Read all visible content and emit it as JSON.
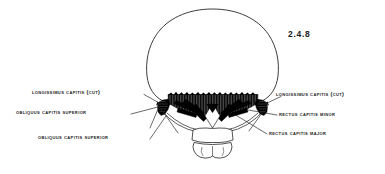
{
  "figure": {
    "number": "2.4.8",
    "background_color": "#ffffff",
    "ink_color": "#1a1a1a",
    "muscle_fill_color": "#000000",
    "bone_outline_color": "#1a1a1a"
  },
  "labels": {
    "left": [
      {
        "id": "longissimus-capitis-cut-left",
        "text": "Longissimus capitis (cut)",
        "side": "left"
      },
      {
        "id": "obliquus-capitis-superior-upper-left",
        "text": "Obliquus capitis superior",
        "side": "left"
      },
      {
        "id": "obliquus-capitis-superior-lower-left",
        "text": "Obliquus capitis superior",
        "side": "left"
      }
    ],
    "right": [
      {
        "id": "longissimus-capitis-cut-right",
        "text": "Longissimus capitis (cut)",
        "side": "right"
      },
      {
        "id": "rectus-capitis-minor-right",
        "text": "Rectus capitis minor",
        "side": "right"
      },
      {
        "id": "rectus-capitis-major-right",
        "text": "Rectus capitis major",
        "side": "right"
      }
    ]
  },
  "anatomy": {
    "view": "posterior view of skull and suboccipital region",
    "structures": [
      "cranial vault outline",
      "occipital muscle mass",
      "suboccipital triangle",
      "obliquus capitis superior (left and right)",
      "rectus capitis minor",
      "rectus capitis major",
      "longissimus capitis (cut)",
      "atlas vertebra",
      "axis vertebra"
    ]
  }
}
